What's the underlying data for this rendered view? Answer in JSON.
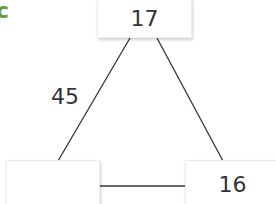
{
  "corner_label": "c",
  "triangle": {
    "top": "17",
    "bottom_left": "",
    "bottom_right": "16",
    "left_edge": "45",
    "right_edge": "",
    "bottom_edge": ""
  },
  "colors": {
    "accent": "#6a9a3a",
    "line": "#333333"
  }
}
